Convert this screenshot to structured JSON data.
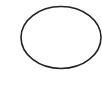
{
  "canvas": {
    "width": 102,
    "height": 86,
    "background": "#ffffff"
  },
  "shape": {
    "type": "ellipse",
    "cx": 61,
    "cy": 37.5,
    "rx": 40,
    "ry": 31,
    "stroke": "#222222",
    "stroke_width": 1.6,
    "fill": "none"
  }
}
